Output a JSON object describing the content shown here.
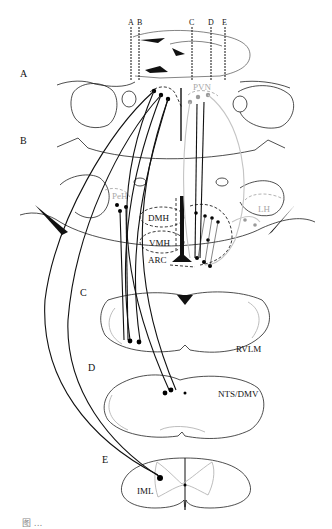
{
  "figure": {
    "type": "neuroanatomical pathway diagram",
    "section_labels": [
      "A",
      "B",
      "C",
      "D",
      "E"
    ],
    "cut_line_labels": [
      "A",
      "B",
      "C",
      "D",
      "E"
    ],
    "nuclei": {
      "pvn": "PVN",
      "peh": "PeH",
      "lh": "LH",
      "dmh": "DMH",
      "vmh": "VMH",
      "arc": "ARC",
      "rvlm": "RVLM",
      "nts_dmv": "NTS/DMV",
      "iml": "IML"
    },
    "colors": {
      "primary_line": "#111111",
      "secondary_line": "#b5b5b5",
      "background": "#ffffff"
    },
    "caption_visible_fragment": "图 ..."
  }
}
